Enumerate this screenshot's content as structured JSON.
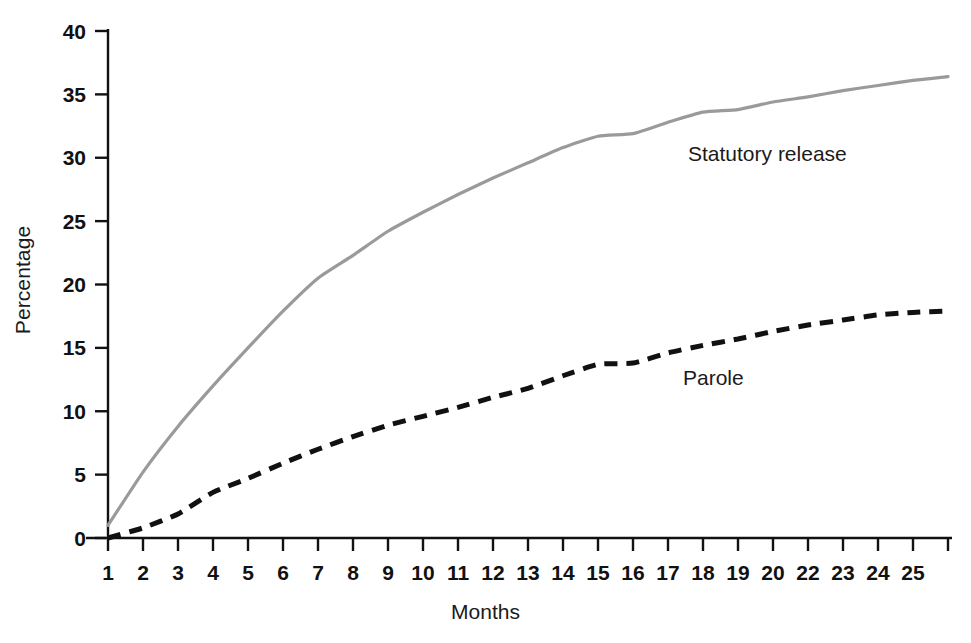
{
  "chart_data": {
    "type": "line",
    "title": "",
    "xlabel": "Months",
    "ylabel": "Percentage",
    "xlim": [
      1,
      25
    ],
    "ylim": [
      0,
      40
    ],
    "grid": false,
    "legend_position": "inline-annotations",
    "x": [
      1,
      2,
      3,
      4,
      5,
      6,
      7,
      8,
      9,
      10,
      11,
      12,
      13,
      14,
      15,
      16,
      17,
      18,
      19,
      20,
      21,
      22,
      23,
      24,
      25
    ],
    "xtick_labels": [
      "1",
      "2",
      "3",
      "4",
      "5",
      "6",
      "7",
      "8",
      "9",
      "10",
      "11",
      "12",
      "13",
      "14",
      "15",
      "16",
      "17",
      "18",
      "19",
      "20",
      "22",
      "23",
      "24",
      "25"
    ],
    "ytick_labels": [
      "0",
      "5",
      "10",
      "15",
      "20",
      "25",
      "30",
      "35",
      "40"
    ],
    "ytick_values": [
      0,
      5,
      10,
      15,
      20,
      25,
      30,
      35,
      40
    ],
    "series": [
      {
        "name": "Statutory release",
        "color": "#9a9a9a",
        "style": "solid",
        "values": [
          1.0,
          5.2,
          8.8,
          12.0,
          15.0,
          17.9,
          20.5,
          22.3,
          24.2,
          25.7,
          27.1,
          28.4,
          29.6,
          30.8,
          31.7,
          31.9,
          32.8,
          33.6,
          33.8,
          34.4,
          34.8,
          35.3,
          35.7,
          36.1,
          36.4
        ]
      },
      {
        "name": "Parole",
        "color": "#111111",
        "style": "dashed",
        "values": [
          0.0,
          0.8,
          1.9,
          3.6,
          4.7,
          5.9,
          7.0,
          8.0,
          8.9,
          9.6,
          10.3,
          11.1,
          11.8,
          12.8,
          13.7,
          13.8,
          14.6,
          15.2,
          15.7,
          16.3,
          16.8,
          17.2,
          17.6,
          17.8,
          17.9
        ]
      }
    ],
    "annotations": [
      {
        "text": "Statutory release",
        "series": "Statutory release"
      },
      {
        "text": "Parole",
        "series": "Parole"
      }
    ]
  },
  "axes": {
    "y_axis_label": "Percentage",
    "x_axis_label": "Months"
  }
}
